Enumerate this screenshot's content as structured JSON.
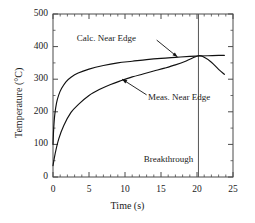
{
  "chart_data": {
    "type": "line",
    "title": "",
    "xlabel": "Time (s)",
    "ylabel": "Temperature (°C)",
    "xlim": [
      0,
      25
    ],
    "ylim": [
      0,
      500
    ],
    "xticks": [
      0,
      5,
      10,
      15,
      20,
      25
    ],
    "yticks": [
      0,
      100,
      200,
      300,
      400,
      500
    ],
    "xtick_labels": [
      "0",
      "5",
      "10",
      "15",
      "20",
      "25"
    ],
    "ytick_labels": [
      "0",
      "100",
      "200",
      "300",
      "400",
      "500"
    ],
    "x_minor_step": 1,
    "y_minor_step": 50,
    "grid": false,
    "legend": "annotations",
    "frame": "box",
    "line_color": "#111111",
    "axis_color": "#4a4a4a",
    "series": [
      {
        "name": "Calc. Near Edge",
        "label": "Calc. Near Edge",
        "x": [
          0.0,
          0.1,
          0.25,
          0.5,
          0.8,
          1.2,
          1.8,
          2.5,
          3.5,
          5.0,
          7.0,
          9.0,
          11.0,
          13.0,
          15.0,
          17.0,
          19.0,
          20.2,
          21.5,
          23.0,
          23.8
        ],
        "y": [
          100,
          150,
          192,
          228,
          252,
          272,
          292,
          306,
          319,
          331,
          342,
          350,
          355,
          360,
          364,
          367,
          370,
          371,
          372,
          373,
          373
        ]
      },
      {
        "name": "Meas. Near Edge",
        "label": "Meas. Near Edge",
        "x": [
          0.0,
          0.3,
          0.8,
          1.5,
          2.5,
          3.5,
          5.0,
          6.5,
          8.0,
          9.5,
          11.0,
          12.5,
          14.0,
          15.5,
          17.0,
          18.5,
          20.2,
          21.0,
          22.0,
          23.0,
          23.8
        ],
        "y": [
          35,
          72,
          117,
          158,
          198,
          222,
          250,
          269,
          284,
          296,
          307,
          316,
          325,
          334,
          344,
          356,
          372,
          367,
          352,
          330,
          315
        ]
      }
    ],
    "annotations": [
      {
        "name": "calc-label",
        "text": "Calc. Near Edge",
        "text_x": 3.3,
        "text_y": 423,
        "leader_from_x": 14.4,
        "leader_from_y": 420,
        "leader_to_x": 17.3,
        "leader_to_y": 368,
        "arrow": true
      },
      {
        "name": "meas-label",
        "text": "Meas. Near Edge",
        "text_x": 13.2,
        "text_y": 243,
        "leader_from_x": 13.0,
        "leader_from_y": 252,
        "leader_to_x": 9.6,
        "leader_to_y": 300,
        "arrow": true
      },
      {
        "name": "breakthrough-label",
        "text": "Breakthrough",
        "text_x": 12.6,
        "text_y": 52,
        "arrow": false
      }
    ],
    "vlines": [
      {
        "name": "breakthrough-line",
        "x": 20.2,
        "color": "#555555"
      }
    ]
  }
}
